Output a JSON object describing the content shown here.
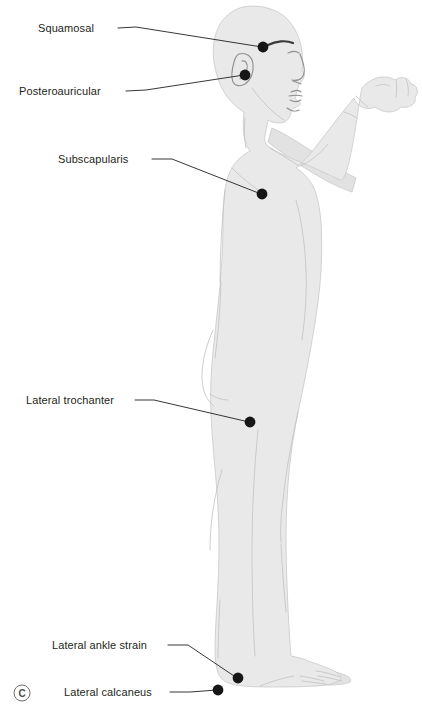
{
  "figure": {
    "panel_letter": "C",
    "view": "lateral-right-profile",
    "background_color": "#ffffff",
    "body_fill_color": "#e9e9e9",
    "body_outline_color": "#c9c9c9",
    "marker_color": "#161616",
    "leader_color": "#231f20",
    "label_color": "#231f20"
  },
  "labels": [
    {
      "id": "squamosal",
      "text": "Squamosal",
      "text_x": 38,
      "text_y": 32,
      "leader": "M 118,28 L 136,27 L 262,47",
      "dot_x": 263,
      "dot_y": 47,
      "dot_r": 5.4
    },
    {
      "id": "posteroauricular",
      "text": "Posteroauricular",
      "text_x": 19,
      "text_y": 95,
      "leader": "M 126,91 L 146,90 L 244,75",
      "dot_x": 245,
      "dot_y": 75,
      "dot_r": 5.4
    },
    {
      "id": "subscapularis",
      "text": "Subscapularis",
      "text_x": 58,
      "text_y": 163,
      "leader": "M 152,159 L 172,159 L 261,194",
      "dot_x": 262,
      "dot_y": 194,
      "dot_r": 5.4
    },
    {
      "id": "lateral-trochanter",
      "text": "Lateral trochanter",
      "text_x": 26,
      "text_y": 404,
      "leader": "M 135,400 L 154,400 L 249,422",
      "dot_x": 250,
      "dot_y": 422,
      "dot_r": 5.4
    },
    {
      "id": "lateral-ankle-strain",
      "text": "Lateral ankle strain",
      "text_x": 52,
      "text_y": 649,
      "leader": "M 168,645 L 188,645 L 237,678",
      "dot_x": 238,
      "dot_y": 678,
      "dot_r": 5.4
    },
    {
      "id": "lateral-calcaneus",
      "text": "Lateral calcaneus",
      "text_x": 64,
      "text_y": 696,
      "leader": "M 170,692 L 190,692 L 217,690",
      "dot_x": 218,
      "dot_y": 690,
      "dot_r": 5.4
    }
  ],
  "panel_marker": {
    "letter": "C",
    "cx": 22,
    "cy": 693,
    "r": 8
  }
}
